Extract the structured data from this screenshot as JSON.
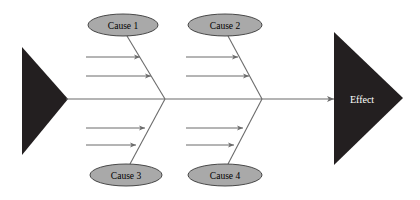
{
  "diagram": {
    "type": "fishbone-ishikawa",
    "title": "",
    "colors": {
      "triangle_fill": "#231f20",
      "ellipse_fill": "#a9a9a9",
      "ellipse_stroke": "#3a3a3a",
      "line": "#6b6b6b",
      "background": "#ffffff",
      "cause_text": "#000000",
      "effect_text": "#ffffff"
    },
    "spine": {
      "y": 99,
      "x_start": 66,
      "x_end": 334,
      "arrowhead": "right-arrow-icon"
    },
    "head_triangle": {
      "label": "Effect",
      "points": "334,32 403,98 334,165",
      "label_x": 362,
      "label_y": 99
    },
    "tail_triangle": {
      "points": "22,47 68,99 22,155"
    },
    "causes": [
      {
        "id": "cause-1",
        "label": "Cause 1",
        "position": "top",
        "ellipse": {
          "cx": 123,
          "cy": 25,
          "rx": 35,
          "ry": 11
        },
        "rib": {
          "x1": 127,
          "y1": 36,
          "x2": 165,
          "y2": 99
        },
        "sub_branches": [
          {
            "id": "cause-1-sub-1",
            "x1": 86,
            "y1": 57,
            "x2": 140,
            "y2": 57
          },
          {
            "id": "cause-1-sub-2",
            "x1": 86,
            "y1": 76,
            "x2": 151,
            "y2": 76
          }
        ]
      },
      {
        "id": "cause-2",
        "label": "Cause 2",
        "position": "top",
        "ellipse": {
          "cx": 225,
          "cy": 25,
          "rx": 37,
          "ry": 11
        },
        "rib": {
          "x1": 228,
          "y1": 36,
          "x2": 262,
          "y2": 99
        },
        "sub_branches": [
          {
            "id": "cause-2-sub-1",
            "x1": 186,
            "y1": 57,
            "x2": 238,
            "y2": 57
          },
          {
            "id": "cause-2-sub-2",
            "x1": 186,
            "y1": 76,
            "x2": 249,
            "y2": 76
          }
        ]
      },
      {
        "id": "cause-3",
        "label": "Cause 3",
        "position": "bottom",
        "ellipse": {
          "cx": 126,
          "cy": 175,
          "rx": 36,
          "ry": 11
        },
        "rib": {
          "x1": 165,
          "y1": 99,
          "x2": 130,
          "y2": 164
        },
        "sub_branches": [
          {
            "id": "cause-3-sub-1",
            "x1": 86,
            "y1": 128,
            "x2": 145,
            "y2": 128
          },
          {
            "id": "cause-3-sub-2",
            "x1": 86,
            "y1": 145,
            "x2": 136,
            "y2": 145
          }
        ]
      },
      {
        "id": "cause-4",
        "label": "Cause 4",
        "position": "bottom",
        "ellipse": {
          "cx": 225,
          "cy": 175,
          "rx": 37,
          "ry": 11
        },
        "rib": {
          "x1": 262,
          "y1": 99,
          "x2": 228,
          "y2": 164
        },
        "sub_branches": [
          {
            "id": "cause-4-sub-1",
            "x1": 186,
            "y1": 128,
            "x2": 243,
            "y2": 128
          },
          {
            "id": "cause-4-sub-2",
            "x1": 186,
            "y1": 145,
            "x2": 234,
            "y2": 145
          }
        ]
      }
    ]
  }
}
